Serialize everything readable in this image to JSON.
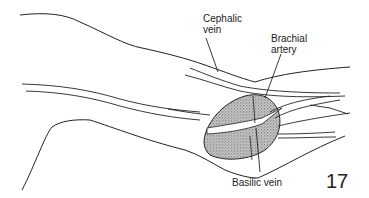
{
  "figure": {
    "number": "17"
  },
  "labels": {
    "cephalic_vein": "Cephalic\nvein",
    "brachial_artery": "Brachial\nartery",
    "basilic_vein": "Basilic vein"
  },
  "colors": {
    "stroke": "#222222",
    "stipple": "#9a9a9a",
    "background": "#ffffff"
  }
}
